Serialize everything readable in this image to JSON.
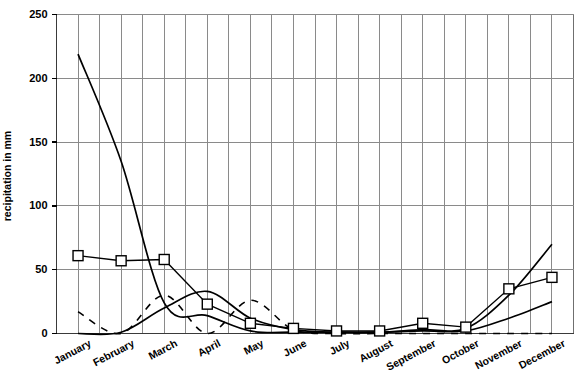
{
  "chart_data": {
    "type": "line",
    "title": "",
    "xlabel": "",
    "ylabel": "recipitation in mm",
    "ylim": [
      0,
      250
    ],
    "yticks": [
      0,
      50,
      100,
      150,
      200,
      250
    ],
    "grid": true,
    "legend_position": "none",
    "categories": [
      "January",
      "February",
      "March",
      "April",
      "May",
      "June",
      "July",
      "August",
      "September",
      "October",
      "November",
      "December"
    ],
    "series": [
      {
        "name": "square-marker series",
        "style": "line-with-open-square-markers",
        "values": [
          61,
          57,
          58,
          23,
          8,
          4,
          2,
          2,
          8,
          5,
          35,
          44
        ]
      },
      {
        "name": "steeply-falling solid curve",
        "style": "smooth-solid-line",
        "values": [
          219,
          135,
          24,
          14,
          2,
          1,
          1,
          1,
          2,
          2,
          12,
          25
        ]
      },
      {
        "name": "secondary solid curve",
        "style": "smooth-solid-line",
        "values": [
          0,
          1,
          20,
          33,
          12,
          3,
          1,
          1,
          3,
          4,
          30,
          70
        ]
      },
      {
        "name": "dashed series",
        "style": "dashed-line",
        "values": [
          17,
          0,
          30,
          0,
          26,
          3,
          0,
          0,
          0,
          0,
          0,
          0
        ]
      }
    ]
  },
  "axis": {
    "y_label": "recipitation in mm",
    "y_tick_labels": [
      "250",
      "200",
      "150",
      "100",
      "50",
      "0"
    ],
    "x_tick_labels": [
      "January",
      "February",
      "March",
      "April",
      "May",
      "June",
      "July",
      "August",
      "September",
      "October",
      "November",
      "December"
    ]
  },
  "colors": {
    "background": "#ffffff",
    "grid": "#8a8a8a",
    "series_line": "#000000",
    "marker_fill": "#ffffff",
    "axis": "#3a3a3a"
  }
}
